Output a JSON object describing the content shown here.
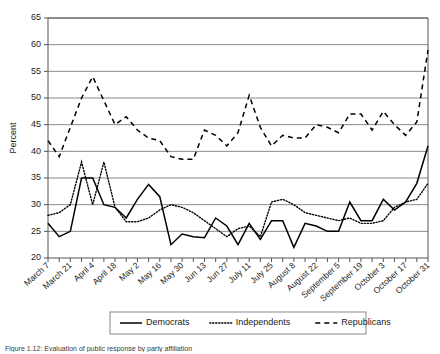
{
  "figure": {
    "caption": "Figure 1.12: Evaluation of public response by party affiliation",
    "top_note": "",
    "ylabel": "Percent"
  },
  "legend": {
    "position": "bottom-center",
    "entries": [
      {
        "label": "Democrats",
        "style": "solid"
      },
      {
        "label": "Independents",
        "style": "dotted"
      },
      {
        "label": "Republicans",
        "style": "dashed"
      }
    ]
  },
  "chart_data": {
    "type": "line",
    "title": "",
    "xlabel": "",
    "ylabel": "Percent",
    "ylim": [
      20,
      65
    ],
    "ytick_values": [
      20,
      25,
      30,
      35,
      40,
      45,
      50,
      55,
      60,
      65
    ],
    "ytick_labels": [
      "20",
      "25",
      "30",
      "35",
      "40",
      "45",
      "50",
      "55",
      "60",
      "65"
    ],
    "grid": true,
    "grid_axis": "y",
    "x": [
      "March 7",
      "March 14",
      "March 21",
      "March 28",
      "April 4",
      "April 11",
      "April 18",
      "April 25",
      "May 2",
      "May 9",
      "May 16",
      "May 23",
      "May 30",
      "Jun 6",
      "Jun 13",
      "Jun 20",
      "Jun 27",
      "July 4",
      "July 11",
      "July 18",
      "July 25",
      "August 1",
      "August 8",
      "August 15",
      "August 22",
      "August 29",
      "September 5",
      "September 12",
      "September 19",
      "September 26",
      "October 3",
      "October 10",
      "October 17",
      "October 24",
      "October 31"
    ],
    "xtick_labels": [
      "March 7",
      "March 21",
      "April 4",
      "April 18",
      "May 2",
      "May 16",
      "May 30",
      "Jun 13",
      "Jun 27",
      "July 11",
      "July 25",
      "August 8",
      "August 22",
      "September 5",
      "September 19",
      "October 3",
      "October 17",
      "October 31"
    ],
    "xtick_label_every": 2,
    "series": [
      {
        "name": "Democrats",
        "style": "solid",
        "values": [
          26.5,
          24.0,
          25.0,
          35.0,
          35.0,
          30.0,
          29.5,
          27.5,
          31.0,
          33.8,
          31.5,
          22.5,
          24.5,
          24.0,
          23.8,
          27.5,
          26.0,
          22.5,
          26.5,
          23.5,
          27.0,
          27.0,
          22.0,
          26.5,
          26.0,
          25.0,
          25.0,
          30.5,
          27.0,
          27.0,
          31.0,
          29.0,
          30.5,
          34.0,
          41.0
        ]
      },
      {
        "name": "Independents",
        "style": "dotted",
        "values": [
          28.0,
          28.5,
          30.0,
          38.0,
          30.0,
          38.0,
          29.5,
          26.8,
          26.8,
          27.5,
          29.0,
          30.0,
          29.5,
          28.5,
          27.0,
          25.5,
          24.0,
          25.5,
          26.0,
          24.0,
          30.5,
          31.0,
          30.0,
          28.5,
          28.0,
          27.5,
          27.0,
          27.5,
          26.5,
          26.5,
          27.0,
          29.5,
          30.5,
          31.0,
          34.0
        ]
      },
      {
        "name": "Republicans",
        "style": "dashed",
        "values": [
          42.0,
          39.0,
          44.5,
          50.0,
          54.0,
          49.5,
          45.0,
          46.5,
          44.0,
          42.5,
          42.0,
          39.0,
          38.5,
          38.5,
          44.0,
          43.0,
          41.0,
          43.5,
          50.5,
          44.5,
          41.0,
          43.0,
          42.5,
          42.5,
          45.0,
          44.5,
          43.5,
          47.0,
          47.0,
          44.0,
          47.5,
          45.0,
          43.0,
          45.5,
          59.0
        ]
      }
    ]
  }
}
